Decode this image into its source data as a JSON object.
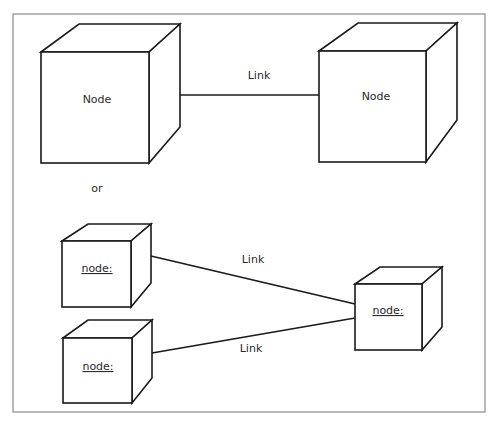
{
  "diagram": {
    "type": "network-node-notation",
    "top_section": {
      "node_left": {
        "label": "Node"
      },
      "link": {
        "label": "Link"
      },
      "node_right": {
        "label": "Node"
      }
    },
    "separator": {
      "label": "or"
    },
    "bottom_section": {
      "node_top_left": {
        "label": "node:",
        "underlined": true
      },
      "node_bottom_left": {
        "label": "node:",
        "underlined": true
      },
      "node_right": {
        "label": "node:",
        "underlined": true
      },
      "link_top": {
        "label": "Link"
      },
      "link_bottom": {
        "label": "Link"
      }
    },
    "colors": {
      "stroke": "#1a1a1a",
      "frame": "#8a8a8a",
      "background": "#ffffff"
    }
  }
}
